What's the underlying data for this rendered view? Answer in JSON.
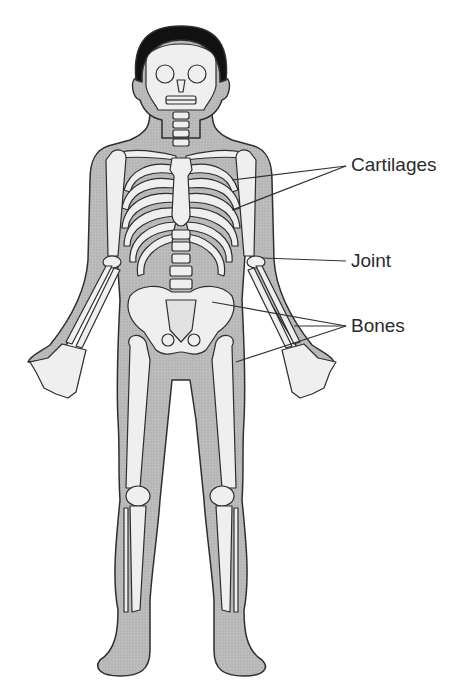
{
  "figure": {
    "colors": {
      "body_fill": "#b9b9b9",
      "bone_fill": "#efefef",
      "outline": "#2e2e2e",
      "hair": "#111111",
      "label_text": "#2b2b2b",
      "leader_line": "#333333"
    }
  },
  "labels": [
    {
      "id": "cartilages",
      "text": "Cartilages",
      "x": 351,
      "y": 155
    },
    {
      "id": "joint",
      "text": "Joint",
      "x": 351,
      "y": 251
    },
    {
      "id": "bones",
      "text": "Bones",
      "x": 351,
      "y": 316
    }
  ]
}
